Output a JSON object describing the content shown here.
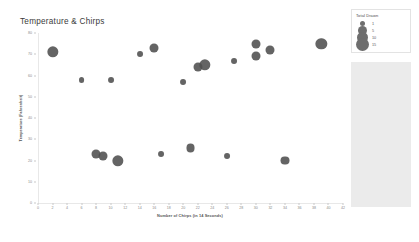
{
  "chart_data": {
    "type": "scatter",
    "title": "Temperature & Chirps",
    "xlabel": "Number of Chirps (in 14 Seconds)",
    "ylabel": "Temperature (Fahrenheit)",
    "xlim": [
      0,
      42
    ],
    "ylim": [
      0,
      80
    ],
    "xticks": [
      0,
      2,
      4,
      6,
      8,
      10,
      12,
      14,
      16,
      18,
      20,
      22,
      24,
      26,
      28,
      30,
      32,
      34,
      36,
      38,
      40,
      42
    ],
    "yticks": [
      0,
      10,
      20,
      30,
      40,
      50,
      60,
      70,
      80
    ],
    "grid": false,
    "legend_position": "top-right",
    "marker_color": "#4e4e4e",
    "size_field": "Total Drawn",
    "points": [
      {
        "x": 2,
        "y": 71,
        "size": 10
      },
      {
        "x": 6,
        "y": 58,
        "size": 1
      },
      {
        "x": 8,
        "y": 23,
        "size": 5
      },
      {
        "x": 9,
        "y": 22,
        "size": 5
      },
      {
        "x": 10,
        "y": 58,
        "size": 1
      },
      {
        "x": 11,
        "y": 20,
        "size": 10
      },
      {
        "x": 14,
        "y": 70,
        "size": 1
      },
      {
        "x": 16,
        "y": 73,
        "size": 5
      },
      {
        "x": 17,
        "y": 23,
        "size": 1
      },
      {
        "x": 20,
        "y": 57,
        "size": 1
      },
      {
        "x": 21,
        "y": 26,
        "size": 5
      },
      {
        "x": 22,
        "y": 64,
        "size": 5
      },
      {
        "x": 23,
        "y": 65,
        "size": 10
      },
      {
        "x": 26,
        "y": 22,
        "size": 1
      },
      {
        "x": 27,
        "y": 67,
        "size": 1
      },
      {
        "x": 30,
        "y": 75,
        "size": 5
      },
      {
        "x": 30,
        "y": 69,
        "size": 5
      },
      {
        "x": 32,
        "y": 72,
        "size": 5
      },
      {
        "x": 34,
        "y": 20,
        "size": 5
      },
      {
        "x": 39,
        "y": 75,
        "size": 10
      }
    ]
  },
  "legend": {
    "title": "Total Drawn",
    "entries": [
      {
        "label": "1",
        "size": 1
      },
      {
        "label": "5",
        "size": 5
      },
      {
        "label": "10",
        "size": 10
      },
      {
        "label": "15",
        "size": 15
      }
    ]
  }
}
